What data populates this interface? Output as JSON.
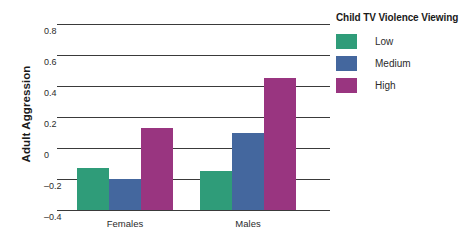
{
  "chart_data": {
    "type": "bar",
    "title": "",
    "xlabel": "",
    "ylabel": "Adult Aggression",
    "categories": [
      "Females",
      "Males"
    ],
    "series": [
      {
        "name": "Low",
        "color": "#2f9c79",
        "values": [
          -0.13,
          -0.15
        ]
      },
      {
        "name": "Medium",
        "color": "#44679e",
        "values": [
          -0.2,
          0.1
        ]
      },
      {
        "name": "High",
        "color": "#993580",
        "values": [
          0.13,
          0.45
        ]
      }
    ],
    "ylim": [
      -0.4,
      0.8
    ],
    "yticks": [
      0.8,
      0.6,
      0.4,
      0.2,
      0,
      -0.2,
      -0.4
    ],
    "ytick_labels": [
      "0.8",
      "0.6",
      "0.4",
      "0.2",
      "0",
      "–0.2",
      "–0.4"
    ],
    "grid": true,
    "legend_position": "right",
    "legend_title": "Child TV Violence Viewing"
  },
  "axis": {
    "y_title": "Adult Aggression"
  },
  "legend": {
    "title": "Child TV Violence Viewing",
    "items": [
      {
        "label": "Low",
        "color": "#2f9c79"
      },
      {
        "label": "Medium",
        "color": "#44679e"
      },
      {
        "label": "High",
        "color": "#993580"
      }
    ]
  }
}
